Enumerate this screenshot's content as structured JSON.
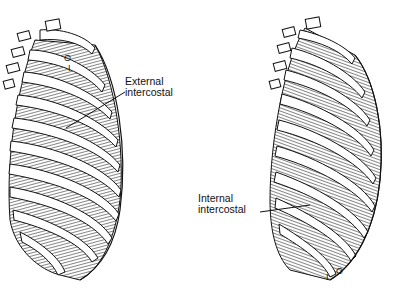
{
  "figures": [
    {
      "id": "left",
      "label_lines": [
        "External",
        "intercostal"
      ],
      "origin_mark": "O",
      "insertion_mark": "I"
    },
    {
      "id": "right",
      "label_lines": [
        "Internal",
        "intercostal"
      ],
      "origin_mark": "O",
      "insertion_mark": "I"
    }
  ],
  "colors": {
    "ink": "#111111",
    "muscle": "#555555",
    "background": "#ffffff"
  }
}
